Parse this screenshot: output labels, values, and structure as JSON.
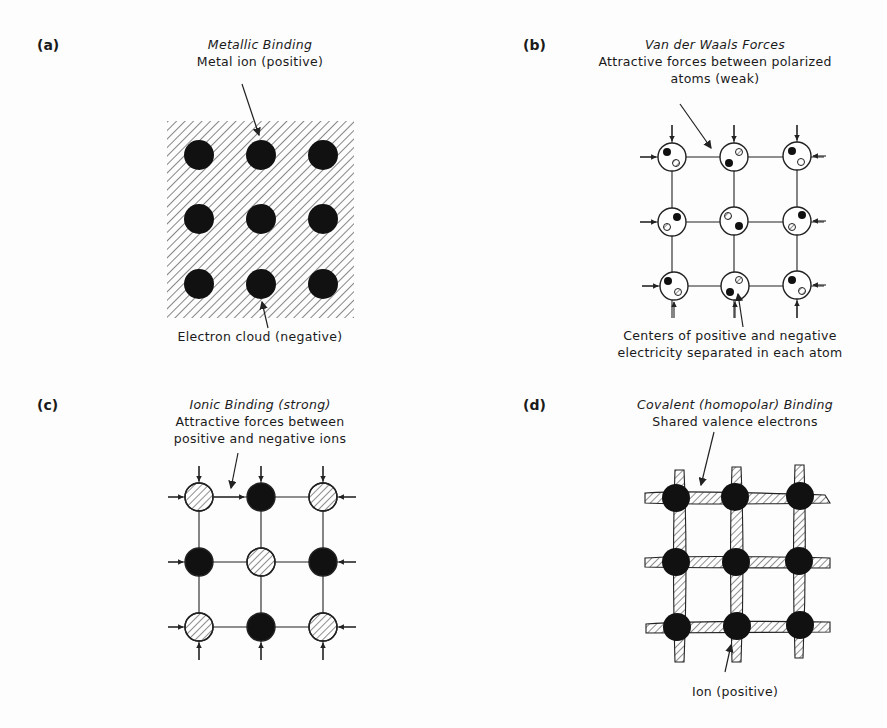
{
  "panels": {
    "a": {
      "label": "(a)",
      "title": "Metallic Binding",
      "top_caption": "Metal ion (positive)",
      "bottom_caption": "Electron cloud (negative)"
    },
    "b": {
      "label": "(b)",
      "title": "Van der Waals Forces",
      "top_caption_1": "Attractive forces between polarized",
      "top_caption_2": "atoms (weak)",
      "bottom_caption_1": "Centers of positive and negative",
      "bottom_caption_2": "electricity separated in each atom"
    },
    "c": {
      "label": "(c)",
      "title": "Ionic Binding (strong)",
      "top_caption_1": "Attractive forces between",
      "top_caption_2": "positive and negative ions"
    },
    "d": {
      "label": "(d)",
      "title": "Covalent (homopolar) Binding",
      "top_caption": "Shared valence electrons",
      "bottom_caption": "Ion (positive)"
    }
  }
}
